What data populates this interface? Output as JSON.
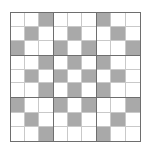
{
  "figure": {
    "name": "nine-by-nine-shaded-grid",
    "rows": 9,
    "columns": 9,
    "block_rows": 3,
    "block_columns": 3,
    "colors": {
      "background": "#ffffff",
      "cell_empty": "#ffffff",
      "cell_filled": "#a9a9a9",
      "cell_gridline": "#c9c9c9",
      "block_gridline": "#6e6e6e",
      "outer_border": "#6e6e6e"
    },
    "legend": {
      "filled_label": "shaded",
      "empty_label": "blank"
    },
    "shaded_cells_by_row": [
      [
        3,
        7
      ],
      [
        2,
        5,
        8
      ],
      [
        1,
        4,
        6,
        9
      ],
      [
        3,
        5,
        7
      ],
      [
        2,
        4,
        6,
        8
      ],
      [
        3,
        5,
        7
      ],
      [
        1,
        4,
        6,
        9
      ],
      [
        2,
        5,
        8
      ],
      [
        3,
        7
      ]
    ],
    "matrix": [
      [
        0,
        0,
        1,
        0,
        0,
        0,
        1,
        0,
        0
      ],
      [
        0,
        1,
        0,
        0,
        1,
        0,
        0,
        1,
        0
      ],
      [
        1,
        0,
        0,
        1,
        0,
        1,
        0,
        0,
        1
      ],
      [
        0,
        0,
        1,
        0,
        1,
        0,
        1,
        0,
        0
      ],
      [
        0,
        1,
        0,
        1,
        0,
        1,
        0,
        1,
        0
      ],
      [
        0,
        0,
        1,
        0,
        1,
        0,
        1,
        0,
        0
      ],
      [
        1,
        0,
        0,
        1,
        0,
        1,
        0,
        0,
        1
      ],
      [
        0,
        1,
        0,
        0,
        1,
        0,
        0,
        1,
        0
      ],
      [
        0,
        0,
        1,
        0,
        0,
        0,
        1,
        0,
        0
      ]
    ],
    "shaded_count": 27,
    "total_cells": 81
  }
}
